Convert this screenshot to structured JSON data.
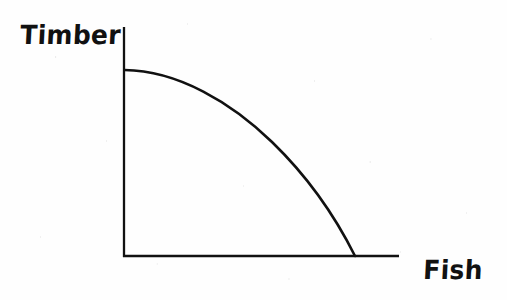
{
  "figure": {
    "kind": "hand-drawn-line-diagram",
    "background_color": "#fefefe",
    "ink_color": "#111111"
  },
  "labels": {
    "y_axis": "Timber",
    "x_axis": "Fish"
  },
  "chart_data": {
    "type": "line",
    "title": "",
    "subtitle": "",
    "xlabel": "Fish",
    "ylabel": "Timber",
    "grid": false,
    "legend": null,
    "legend_position": "none",
    "xlim": [
      0,
      100
    ],
    "ylim": [
      0,
      100
    ],
    "xticks": [],
    "yticks": [],
    "xticklabels": [],
    "yticklabels": [],
    "axis_style": "two-spine-open",
    "annotations": [],
    "series": [
      {
        "name": "Production possibilities frontier",
        "shape": "concave-to-origin",
        "color": "#111111",
        "x": [
          0,
          11,
          33,
          46,
          58,
          70,
          78,
          86,
          92,
          97,
          100
        ],
        "y": [
          80,
          79,
          73,
          68,
          60,
          50,
          42,
          32,
          22,
          11,
          0
        ]
      }
    ]
  },
  "geometry": {
    "y_axis": {
      "x": 124,
      "y_top": 27,
      "y_bottom": 257
    },
    "x_axis": {
      "y": 256,
      "x_left": 123,
      "x_right": 399
    },
    "curve_start": {
      "x": 124,
      "y": 70
    },
    "curve_end": {
      "x": 355,
      "y": 256
    },
    "curve_path": "M 124.5 70 C 178 70.5 232 103 272 142 C 304 173 334 214 355 256",
    "stroke_width_axis": 2.3,
    "stroke_width_curve": 2.6
  }
}
